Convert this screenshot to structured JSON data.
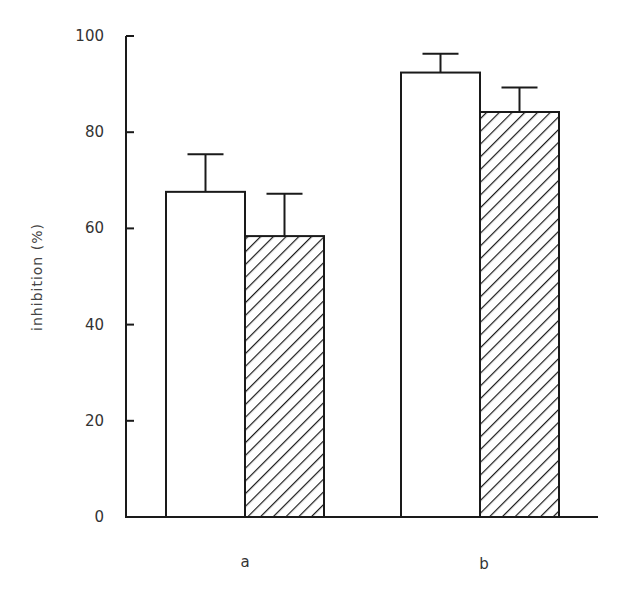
{
  "chart_data": {
    "type": "bar",
    "title": "",
    "xlabel": "",
    "ylabel": "inhibition (%)",
    "ylim": [
      0,
      100
    ],
    "yticks": [
      0,
      20,
      40,
      60,
      80,
      100
    ],
    "categories": [
      "a",
      "b"
    ],
    "grid": false,
    "legend": null,
    "series": [
      {
        "name": "open bars",
        "fill": "white",
        "values": [
          67.6,
          92.4
        ],
        "error_upper": [
          7.8,
          3.9
        ]
      },
      {
        "name": "hatched bars",
        "fill": "diagonal-hatch",
        "values": [
          58.4,
          84.2
        ],
        "error_upper": [
          8.8,
          5.1
        ]
      }
    ]
  },
  "axis": {
    "ylabel": "inhibition (%)",
    "yticks": [
      "0",
      "20",
      "40",
      "60",
      "80",
      "100"
    ],
    "xticks": [
      "a",
      "b"
    ]
  },
  "colors": {
    "line": "#1a1a1a",
    "background": "#ffffff"
  }
}
